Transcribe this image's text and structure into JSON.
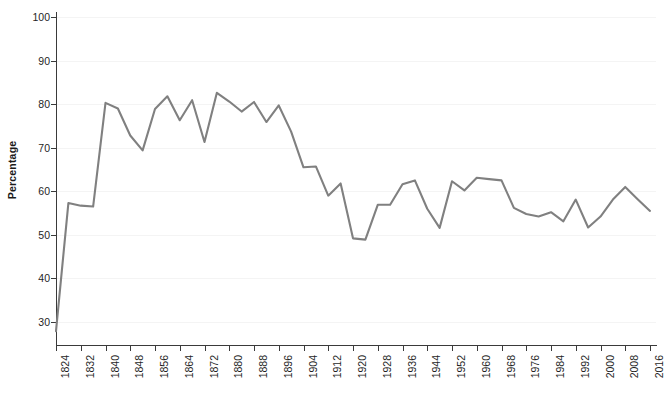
{
  "chart_data": {
    "type": "line",
    "title": "",
    "xlabel": "",
    "ylabel": "Percentage",
    "xlim": [
      1824,
      2016
    ],
    "ylim": [
      25,
      100
    ],
    "grid": true,
    "legend": "none",
    "line_color": "#808080",
    "y_ticks": [
      30,
      40,
      50,
      60,
      70,
      80,
      90,
      100
    ],
    "y_tick_labels": [
      "30",
      "40",
      "50",
      "60",
      "70",
      "80",
      "90",
      "100"
    ],
    "x_ticks": [
      1824,
      1832,
      1840,
      1848,
      1856,
      1864,
      1872,
      1880,
      1888,
      1896,
      1904,
      1912,
      1920,
      1928,
      1936,
      1944,
      1952,
      1960,
      1968,
      1976,
      1984,
      1992,
      2000,
      2008,
      2016
    ],
    "x_tick_labels": [
      "1824",
      "1832",
      "1840",
      "1848",
      "1856",
      "1864",
      "1872",
      "1880",
      "1888",
      "1896",
      "1904",
      "1912",
      "1920",
      "1928",
      "1936",
      "1944",
      "1952",
      "1960",
      "1968",
      "1976",
      "1984",
      "1992",
      "2000",
      "2008",
      "2016"
    ],
    "x": [
      1824,
      1828,
      1832,
      1836,
      1840,
      1844,
      1848,
      1852,
      1856,
      1860,
      1864,
      1868,
      1872,
      1876,
      1880,
      1884,
      1888,
      1892,
      1896,
      1900,
      1904,
      1908,
      1912,
      1916,
      1920,
      1924,
      1928,
      1932,
      1936,
      1940,
      1944,
      1948,
      1952,
      1956,
      1960,
      1964,
      1968,
      1972,
      1976,
      1980,
      1984,
      1988,
      1992,
      1996,
      2000,
      2004,
      2008,
      2012,
      2016
    ],
    "values": [
      27.9,
      57.3,
      56.7,
      56.5,
      80.3,
      79.0,
      72.8,
      69.4,
      78.9,
      81.8,
      76.3,
      80.9,
      71.3,
      82.6,
      80.6,
      78.3,
      80.5,
      75.9,
      79.7,
      73.7,
      65.5,
      65.7,
      59.0,
      61.8,
      49.2,
      48.9,
      56.9,
      56.9,
      61.6,
      62.5,
      56.0,
      51.6,
      62.3,
      60.2,
      63.1,
      62.8,
      62.5,
      56.2,
      54.8,
      54.2,
      55.2,
      53.1,
      58.1,
      51.7,
      54.2,
      58.1,
      61.0,
      58.2,
      55.5
    ]
  }
}
